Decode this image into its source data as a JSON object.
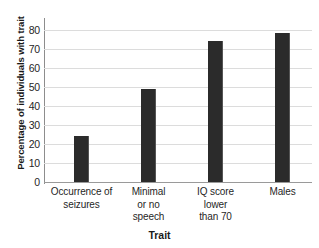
{
  "chart_data": {
    "type": "bar",
    "title": "",
    "subtitle": "",
    "xlabel": "Trait",
    "ylabel": "Percentage of individuals with trait",
    "categories": [
      "Occurrence of seizures",
      "Minimal or no speech",
      "IQ score lower than 70",
      "Males"
    ],
    "category_lines": [
      [
        "Occurrence of",
        "seizures"
      ],
      [
        "Minimal",
        "or no",
        "speech"
      ],
      [
        "IQ score",
        "lower",
        "than 70"
      ],
      [
        "Males"
      ]
    ],
    "values": [
      24,
      49,
      74,
      78
    ],
    "ylim": [
      0,
      85
    ],
    "yticks": [
      0,
      10,
      20,
      30,
      40,
      50,
      60,
      70,
      80
    ],
    "ytick_labels": [
      "0",
      "10",
      "20",
      "30",
      "40",
      "50",
      "60",
      "70",
      "80"
    ],
    "grid": true,
    "grid_axis": "y",
    "legend": false,
    "legend_position": "none",
    "colors": {
      "bar": "#2b2b2b",
      "bar_highlight": "#555555",
      "gridline": "#dcdcdc",
      "axis": "#8d8d8d",
      "text": "#1a1a1a",
      "background": "#ffffff"
    }
  }
}
